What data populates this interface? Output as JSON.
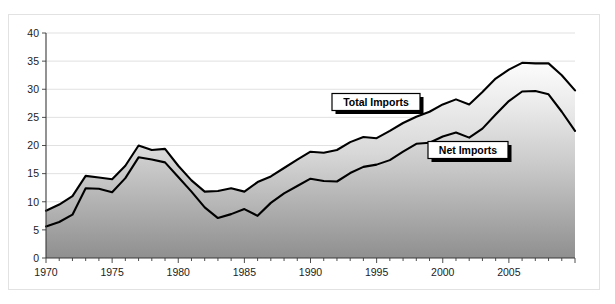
{
  "chart_data": {
    "type": "area",
    "title": "",
    "subtitle": "",
    "xlabel": "",
    "ylabel": "",
    "xlim": [
      1970,
      2010
    ],
    "ylim": [
      0,
      40
    ],
    "y_ticks": [
      0,
      5,
      10,
      15,
      20,
      25,
      30,
      35,
      40
    ],
    "x_ticks": [
      1970,
      1975,
      1980,
      1985,
      1990,
      1995,
      2000,
      2005
    ],
    "grid": true,
    "legend_position": "inline-callouts",
    "stacked": false,
    "x": [
      1970,
      1971,
      1972,
      1973,
      1974,
      1975,
      1976,
      1977,
      1978,
      1979,
      1980,
      1981,
      1982,
      1983,
      1984,
      1985,
      1986,
      1987,
      1988,
      1989,
      1990,
      1991,
      1992,
      1993,
      1994,
      1995,
      1996,
      1997,
      1998,
      1999,
      2000,
      2001,
      2002,
      2003,
      2004,
      2005,
      2006,
      2007,
      2008,
      2009,
      2010
    ],
    "series": [
      {
        "name": "Total Imports",
        "color": "#000000",
        "values": [
          8.4,
          9.5,
          11.0,
          14.6,
          14.3,
          14.0,
          16.4,
          20.0,
          19.2,
          19.4,
          16.4,
          13.8,
          11.8,
          11.9,
          12.4,
          11.8,
          13.5,
          14.5,
          16.0,
          17.5,
          18.9,
          18.7,
          19.2,
          20.6,
          21.5,
          21.3,
          22.6,
          24.0,
          25.1,
          26.0,
          27.3,
          28.2,
          27.3,
          29.5,
          31.9,
          33.5,
          34.7,
          34.6,
          34.6,
          32.5,
          29.8
        ]
      },
      {
        "name": "Net Imports",
        "color": "#000000",
        "values": [
          5.6,
          6.4,
          7.7,
          12.4,
          12.3,
          11.7,
          14.2,
          17.9,
          17.5,
          17.0,
          14.4,
          11.8,
          9.0,
          7.1,
          7.8,
          8.7,
          7.5,
          9.8,
          11.5,
          12.8,
          14.1,
          13.7,
          13.6,
          15.1,
          16.2,
          16.6,
          17.4,
          18.9,
          20.3,
          20.5,
          21.6,
          22.3,
          21.4,
          23.0,
          25.5,
          27.9,
          29.6,
          29.7,
          29.1,
          26.0,
          22.6
        ]
      }
    ],
    "annotations": [
      {
        "label": "Total Imports",
        "target_year": 1996,
        "target_value": 23.0
      },
      {
        "label": "Net Imports",
        "target_year": 2000,
        "target_value": 21.6
      }
    ]
  },
  "axis": {
    "y_tick_labels": [
      "0",
      "5",
      "10",
      "15",
      "20",
      "25",
      "30",
      "35",
      "40"
    ],
    "x_tick_labels": [
      "1970",
      "1975",
      "1980",
      "1985",
      "1990",
      "1995",
      "2000",
      "2005"
    ]
  }
}
